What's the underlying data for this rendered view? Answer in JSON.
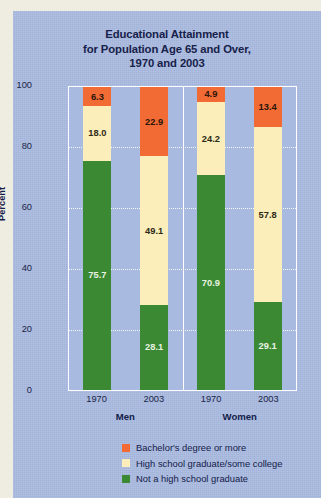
{
  "chart_data": {
    "type": "bar",
    "subtype": "stacked-bar",
    "title": "Educational Attainment for Population Age 65 and Over, 1970 and 2003",
    "title_lines": [
      "Educational Attainment",
      "for Population Age 65 and Over,",
      "1970 and 2003"
    ],
    "xlabel": "",
    "ylabel": "Percent",
    "ylim": [
      0,
      100
    ],
    "yticks": [
      0,
      20,
      40,
      60,
      80,
      100
    ],
    "ytick_labels": [
      "0",
      "20",
      "40",
      "60",
      "80",
      "100"
    ],
    "grid": true,
    "grid_style": "dotted-horizontal-white",
    "legend_position": "bottom-center",
    "groups": [
      "Men",
      "Women"
    ],
    "categories": [
      "1970",
      "2003",
      "1970",
      "2003"
    ],
    "series": [
      {
        "name": "Not a high school graduate",
        "color": "#3b8a33",
        "values": [
          75.7,
          28.1,
          70.9,
          29.1
        ]
      },
      {
        "name": "High school graduate/some college",
        "color": "#fbeebb",
        "values": [
          18.0,
          49.1,
          24.2,
          57.8
        ]
      },
      {
        "name": "Bachelor's degree or more",
        "color": "#f26b35",
        "values": [
          6.3,
          22.9,
          4.9,
          13.4
        ]
      }
    ],
    "bars": [
      {
        "group": "Men",
        "category": "1970",
        "segments": [
          {
            "series": "Bachelor's degree or more",
            "value": 6.3,
            "label": "6.3"
          },
          {
            "series": "High school graduate/some college",
            "value": 18.0,
            "label": "18.0"
          },
          {
            "series": "Not a high school graduate",
            "value": 75.7,
            "label": "75.7"
          }
        ]
      },
      {
        "group": "Men",
        "category": "2003",
        "segments": [
          {
            "series": "Bachelor's degree or more",
            "value": 22.9,
            "label": "22.9"
          },
          {
            "series": "High school graduate/some college",
            "value": 49.1,
            "label": "49.1"
          },
          {
            "series": "Not a high school graduate",
            "value": 28.1,
            "label": "28.1"
          }
        ]
      },
      {
        "group": "Women",
        "category": "1970",
        "segments": [
          {
            "series": "Bachelor's degree or more",
            "value": 4.9,
            "label": "4.9"
          },
          {
            "series": "High school graduate/some college",
            "value": 24.2,
            "label": "24.2"
          },
          {
            "series": "Not a high school graduate",
            "value": 70.9,
            "label": "70.9"
          }
        ]
      },
      {
        "group": "Women",
        "category": "2003",
        "segments": [
          {
            "series": "Bachelor's degree or more",
            "value": 13.4,
            "label": "13.4"
          },
          {
            "series": "High school graduate/some college",
            "value": 57.8,
            "label": "57.8"
          },
          {
            "series": "Not a high school graduate",
            "value": 29.1,
            "label": "29.1"
          }
        ]
      }
    ],
    "legend": [
      {
        "label": "Bachelor's degree or more",
        "color": "#f26b35"
      },
      {
        "label": "High school graduate/some college",
        "color": "#fbeebb"
      },
      {
        "label": "Not a high school graduate",
        "color": "#3b8a33"
      }
    ]
  },
  "colors": {
    "panel_background": "#a9bae0",
    "page_background": "#efece1",
    "plot_frame": "#ffffff",
    "title_text": "#17214a",
    "axis_text": "#1b2545",
    "bachelors": "#f26b35",
    "highschool": "#fbeebb",
    "nohighschool": "#3b8a33"
  }
}
